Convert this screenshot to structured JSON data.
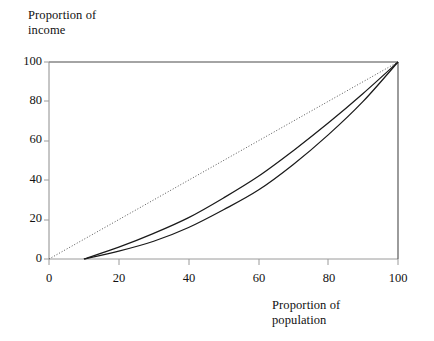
{
  "chart_data": {
    "type": "line",
    "title": "",
    "xlabel": "Proportion of population",
    "ylabel": "Proportion of income",
    "xlim": [
      0,
      100
    ],
    "ylim": [
      0,
      100
    ],
    "grid": false,
    "legend": "none",
    "xticks": [
      "0",
      "20",
      "40",
      "60",
      "80",
      "100"
    ],
    "xtick_values": [
      0,
      20,
      40,
      60,
      80,
      100
    ],
    "yticks": [
      "0",
      "20",
      "40",
      "60",
      "80",
      "100"
    ],
    "ytick_values": [
      0,
      20,
      40,
      60,
      80,
      100
    ],
    "series": [
      {
        "name": "line of equality",
        "style": "dotted",
        "color": "#555555",
        "x": [
          0,
          100
        ],
        "values": [
          0,
          100
        ]
      },
      {
        "name": "lorenz-curve-upper",
        "style": "solid",
        "color": "#1a1a1a",
        "x": [
          10,
          20,
          30,
          40,
          50,
          60,
          70,
          80,
          90,
          100
        ],
        "values": [
          0,
          6,
          13,
          21,
          31,
          42,
          55,
          69,
          84,
          100
        ]
      },
      {
        "name": "lorenz-curve-lower",
        "style": "solid",
        "color": "#1a1a1a",
        "x": [
          10,
          20,
          30,
          40,
          50,
          60,
          70,
          80,
          90,
          100
        ],
        "values": [
          0,
          4,
          9,
          16,
          25,
          35,
          48,
          63,
          80,
          100
        ]
      }
    ],
    "annotations": []
  },
  "axes": {
    "y_title": "Proportion of\nincome",
    "x_title": "Proportion of\npopulation"
  },
  "ytick_labels": {
    "t0": "0",
    "t20": "20",
    "t40": "40",
    "t60": "60",
    "t80": "80",
    "t100": "100"
  },
  "xtick_labels": {
    "t0": "0",
    "t20": "20",
    "t40": "40",
    "t60": "60",
    "t80": "80",
    "t100": "100"
  },
  "colors": {
    "curve": "#1a1a1a",
    "equality_line": "#555555",
    "frame": "#4a4a4a",
    "text": "#111111"
  }
}
